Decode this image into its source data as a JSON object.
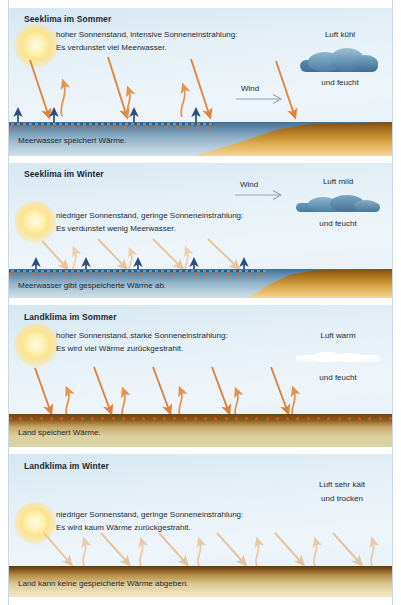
{
  "figure": {
    "kind": "climate-diagram",
    "language": "de",
    "panel_count": 4
  },
  "colors": {
    "sky": "#e4eff7",
    "sun": "#fce38d",
    "sun_arrow_strong": "#e8883f",
    "sun_arrow_weak": "#e8c79a",
    "heat_arrow_navy": "#2b4f7a",
    "evaporation_arrow": "#e2954f",
    "sea": "#5d87a8",
    "land": "#c08a2e",
    "soil_dark": "#6d4513",
    "heat_dot": "#e4692a",
    "cloud_dark": "#4b7fa3",
    "cloud_white": "#ffffff",
    "text": "#1a2733",
    "wind_line": "#8fa6b5"
  },
  "panels": [
    {
      "id": "seeklima-sommer",
      "title": "Seeklima im Sommer",
      "body": [
        "hoher Sonnenstand, intensive Sonneneinstrahlung:",
        "Es verdunstet viel Meerwasser."
      ],
      "air": {
        "line1": "Luft kühl",
        "line2": "und feucht",
        "cloud": "dark-cumulus"
      },
      "wind": {
        "label": "Wind",
        "direction": "right"
      },
      "ground_label": "Meerwasser speichert Wärme.",
      "surface": "sea-with-coast",
      "sun": "high",
      "arrows": {
        "incoming": 4,
        "evaporation": 3,
        "heat_up": 4,
        "incoming_style": "strong-orange",
        "evaporation_style": "wavy-orange",
        "heat_style": "navy-straight"
      },
      "heat_dots": true
    },
    {
      "id": "seeklima-winter",
      "title": "Seeklima im Winter",
      "body": [
        "niedriger Sonnenstand, geringe Sonneneinstrahlung:",
        "Es verdunstet wenig Meerwasser."
      ],
      "air": {
        "line1": "Luft mild",
        "line2": "und feucht",
        "cloud": "dark-stratus"
      },
      "wind": {
        "label": "Wind",
        "direction": "right"
      },
      "ground_label": "Meerwasser gibt gespeicherte Wärme ab.",
      "surface": "sea-with-coast",
      "sun": "low",
      "arrows": {
        "incoming": 4,
        "evaporation": 3,
        "heat_up": 4,
        "incoming_style": "pale-tan",
        "evaporation_style": "wavy-pale",
        "heat_style": "navy-straight"
      },
      "heat_dots": true
    },
    {
      "id": "landklima-sommer",
      "title": "Landklima im Sommer",
      "body": [
        "hoher Sonnenstand, starke Sonneneinstrahlung:",
        "Es wird viel Wärme zurückgestrahlt."
      ],
      "air": {
        "line1": "Luft warm",
        "line2": "und feucht",
        "cloud": "thin-white"
      },
      "wind": null,
      "ground_label": "Land speichert Wärme.",
      "surface": "soil-summer",
      "sun": "high",
      "arrows": {
        "incoming": 5,
        "reflected": 5,
        "incoming_style": "strong-orange",
        "reflected_style": "wavy-orange"
      },
      "heat_dots": true
    },
    {
      "id": "landklima-winter",
      "title": "Landklima im Winter",
      "body": [
        "niedriger Sonnenstand, geringe Sonneneinstrahlung:",
        "Es wird kaum Wärme zurückgestrahlt."
      ],
      "air": {
        "line1": "Luft sehr kalt",
        "line2": "und trocken",
        "cloud": null
      },
      "wind": null,
      "ground_label": "Land kann keine gespeicherte Wärme abgeben.",
      "surface": "soil-winter",
      "sun": "low",
      "arrows": {
        "incoming": 5,
        "reflected": 5,
        "incoming_style": "pale-tan",
        "reflected_style": "pale-tan-up"
      },
      "heat_dots": false
    }
  ]
}
